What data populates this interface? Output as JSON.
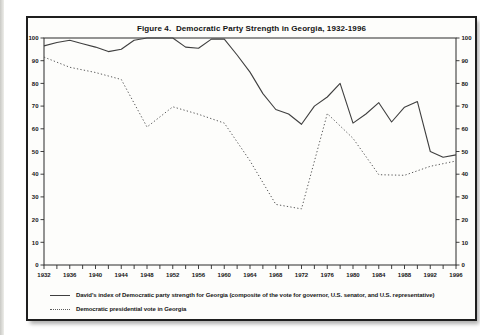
{
  "figure": {
    "title": "Figure 4.  Democratic Party Strength in Georgia, 1932-1996"
  },
  "chart_data": {
    "type": "line",
    "xlabel": "",
    "ylabel": "",
    "xlim": [
      1932,
      1996
    ],
    "ylim": [
      0,
      100
    ],
    "grid": false,
    "legend_position": "bottom-left",
    "x_axis": {
      "tick_step_years": 2,
      "label_step_years": 4,
      "labels": [
        "1932",
        "1936",
        "1940",
        "1944",
        "1948",
        "1952",
        "1956",
        "1960",
        "1964",
        "1968",
        "1972",
        "1976",
        "1980",
        "1984",
        "1988",
        "1992",
        "1996"
      ]
    },
    "y_axis": {
      "sides": [
        "left",
        "right"
      ],
      "tick_step": 10,
      "labels": [
        "0",
        "10",
        "20",
        "30",
        "40",
        "50",
        "60",
        "70",
        "80",
        "90",
        "100"
      ]
    },
    "series": [
      {
        "name": "David's index of Democratic party strength for Georgia (composite of the vote for governor, U.S. senator, and U.S. representative)",
        "style": "solid",
        "color": "#3f3f3f",
        "x": [
          1932,
          1934,
          1936,
          1938,
          1940,
          1942,
          1944,
          1946,
          1948,
          1950,
          1952,
          1954,
          1956,
          1958,
          1960,
          1962,
          1964,
          1966,
          1968,
          1970,
          1972,
          1974,
          1976,
          1978,
          1980,
          1982,
          1984,
          1986,
          1988,
          1990,
          1992,
          1994,
          1996
        ],
        "values": [
          96.5,
          98,
          99,
          97.5,
          96,
          94,
          95,
          99,
          100,
          100,
          100,
          96,
          95.5,
          99.5,
          99.5,
          92.5,
          85,
          75.5,
          68.5,
          66.5,
          62,
          70,
          74,
          80,
          62.5,
          66.5,
          71.5,
          63,
          69.5,
          72,
          50,
          47.5,
          48.5
        ]
      },
      {
        "name": "Democratic presidential vote in Georgia",
        "style": "dotted",
        "color": "#5a5a5a",
        "x": [
          1932,
          1936,
          1940,
          1944,
          1948,
          1952,
          1956,
          1960,
          1964,
          1968,
          1972,
          1976,
          1980,
          1984,
          1988,
          1992,
          1996
        ],
        "values": [
          91.6,
          87.1,
          84.8,
          81.7,
          60.8,
          69.7,
          66.4,
          62.5,
          45.9,
          26.7,
          24.7,
          66.7,
          55.8,
          39.8,
          39.5,
          43.5,
          45.8
        ]
      }
    ]
  }
}
